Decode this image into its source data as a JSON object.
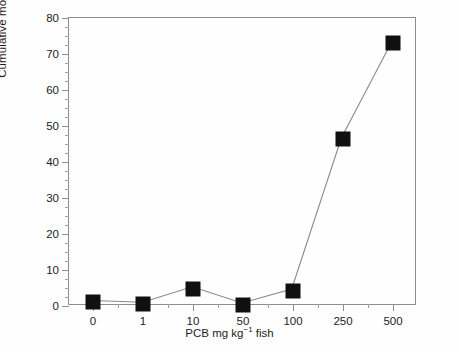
{
  "figure": {
    "background": "#ffffff",
    "axis_color": "#8d8d8d",
    "marker_color": "#101010",
    "line_color": "#8a8a8a"
  },
  "chart_data": {
    "type": "line",
    "title": "",
    "xlabel": "PCB mg kg⁻¹ fish",
    "xlabel_parts": {
      "pre": "PCB mg kg",
      "sup": "−1",
      "post": " fish"
    },
    "ylabel": "Cumulative mortality (%)",
    "categories": [
      "0",
      "1",
      "10",
      "50",
      "100",
      "250",
      "500"
    ],
    "values": [
      1.0,
      0.5,
      4.8,
      0.3,
      4.2,
      46.5,
      73.0
    ],
    "ylim": [
      0,
      80
    ],
    "ytick_labels": [
      "0",
      "10",
      "20",
      "30",
      "40",
      "50",
      "60",
      "70",
      "80"
    ],
    "ytick_values": [
      0,
      10,
      20,
      30,
      40,
      50,
      60,
      70,
      80
    ],
    "yminor_step": 2.5,
    "xminor_per_interval": 1,
    "grid": false,
    "legend": null,
    "marker": "filled-square",
    "series": [
      {
        "name": "Cumulative mortality",
        "values": [
          1.0,
          0.5,
          4.8,
          0.3,
          4.2,
          46.5,
          73.0
        ]
      }
    ]
  }
}
